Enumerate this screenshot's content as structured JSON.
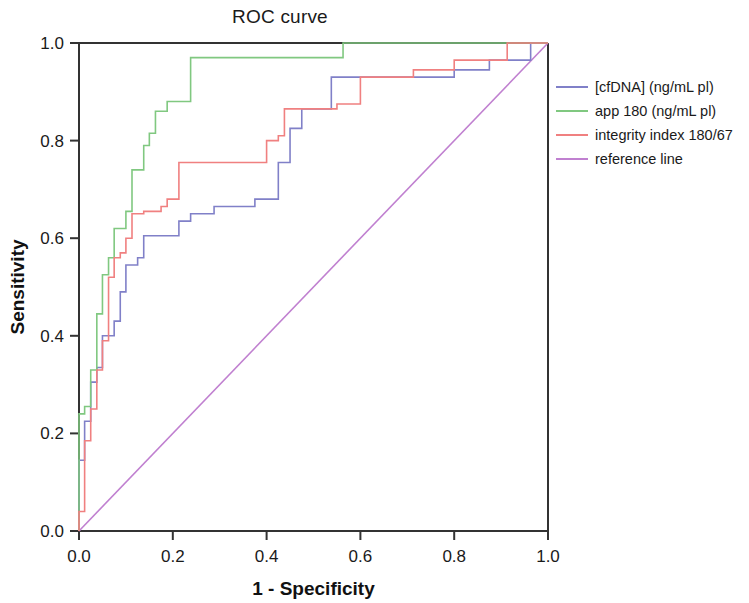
{
  "chart_data": {
    "type": "line",
    "title": "ROC curve",
    "xlabel": "1 - Specificity",
    "ylabel": "Sensitivity",
    "xlim": [
      0.0,
      1.0
    ],
    "ylim": [
      0.0,
      1.0
    ],
    "xticks": [
      "0.0",
      "0.2",
      "0.4",
      "0.6",
      "0.8",
      "1.0"
    ],
    "yticks": [
      "0.0",
      "0.2",
      "0.4",
      "0.6",
      "0.8",
      "1.0"
    ],
    "xtick_values": [
      0.0,
      0.2,
      0.4,
      0.6,
      0.8,
      1.0
    ],
    "ytick_values": [
      0.0,
      0.2,
      0.4,
      0.6,
      0.8,
      1.0
    ],
    "grid": false,
    "legend_position": "right",
    "colors": {
      "cfdna": "#8080c8",
      "app180": "#80c880",
      "integrity": "#f08080",
      "reference": "#c080d0",
      "axis": "#333333",
      "text": "#1a1a1a",
      "background": "#ffffff"
    },
    "series": [
      {
        "name": "[cfDNA] (ng/mL pl)",
        "color": "#8080c8",
        "step": true,
        "points": [
          [
            0.0,
            0.0
          ],
          [
            0.0,
            0.145
          ],
          [
            0.012,
            0.145
          ],
          [
            0.012,
            0.225
          ],
          [
            0.025,
            0.225
          ],
          [
            0.025,
            0.305
          ],
          [
            0.038,
            0.305
          ],
          [
            0.038,
            0.335
          ],
          [
            0.05,
            0.335
          ],
          [
            0.05,
            0.4
          ],
          [
            0.075,
            0.4
          ],
          [
            0.075,
            0.43
          ],
          [
            0.088,
            0.43
          ],
          [
            0.088,
            0.49
          ],
          [
            0.1,
            0.49
          ],
          [
            0.1,
            0.545
          ],
          [
            0.125,
            0.545
          ],
          [
            0.125,
            0.56
          ],
          [
            0.138,
            0.56
          ],
          [
            0.138,
            0.605
          ],
          [
            0.213,
            0.605
          ],
          [
            0.213,
            0.635
          ],
          [
            0.238,
            0.635
          ],
          [
            0.238,
            0.65
          ],
          [
            0.288,
            0.65
          ],
          [
            0.288,
            0.665
          ],
          [
            0.375,
            0.665
          ],
          [
            0.375,
            0.68
          ],
          [
            0.425,
            0.68
          ],
          [
            0.425,
            0.755
          ],
          [
            0.45,
            0.755
          ],
          [
            0.45,
            0.825
          ],
          [
            0.475,
            0.825
          ],
          [
            0.475,
            0.865
          ],
          [
            0.538,
            0.865
          ],
          [
            0.538,
            0.93
          ],
          [
            0.8,
            0.93
          ],
          [
            0.8,
            0.945
          ],
          [
            0.875,
            0.945
          ],
          [
            0.875,
            0.965
          ],
          [
            0.963,
            0.965
          ],
          [
            0.963,
            1.0
          ],
          [
            1.0,
            1.0
          ]
        ]
      },
      {
        "name": "app 180 (ng/mL pl)",
        "color": "#80c880",
        "step": true,
        "points": [
          [
            0.0,
            0.0
          ],
          [
            0.0,
            0.24
          ],
          [
            0.012,
            0.24
          ],
          [
            0.012,
            0.255
          ],
          [
            0.025,
            0.255
          ],
          [
            0.025,
            0.33
          ],
          [
            0.038,
            0.33
          ],
          [
            0.038,
            0.445
          ],
          [
            0.05,
            0.445
          ],
          [
            0.05,
            0.525
          ],
          [
            0.063,
            0.525
          ],
          [
            0.063,
            0.56
          ],
          [
            0.075,
            0.56
          ],
          [
            0.075,
            0.62
          ],
          [
            0.1,
            0.62
          ],
          [
            0.1,
            0.655
          ],
          [
            0.113,
            0.655
          ],
          [
            0.113,
            0.74
          ],
          [
            0.138,
            0.74
          ],
          [
            0.138,
            0.79
          ],
          [
            0.15,
            0.79
          ],
          [
            0.15,
            0.815
          ],
          [
            0.163,
            0.815
          ],
          [
            0.163,
            0.86
          ],
          [
            0.188,
            0.86
          ],
          [
            0.188,
            0.88
          ],
          [
            0.238,
            0.88
          ],
          [
            0.238,
            0.97
          ],
          [
            0.563,
            0.97
          ],
          [
            0.563,
            1.0
          ],
          [
            1.0,
            1.0
          ]
        ]
      },
      {
        "name": "integrity index 180/67",
        "color": "#f08080",
        "step": true,
        "points": [
          [
            0.0,
            0.0
          ],
          [
            0.0,
            0.04
          ],
          [
            0.012,
            0.04
          ],
          [
            0.012,
            0.185
          ],
          [
            0.025,
            0.185
          ],
          [
            0.025,
            0.25
          ],
          [
            0.038,
            0.25
          ],
          [
            0.038,
            0.33
          ],
          [
            0.05,
            0.33
          ],
          [
            0.05,
            0.39
          ],
          [
            0.063,
            0.39
          ],
          [
            0.063,
            0.52
          ],
          [
            0.075,
            0.52
          ],
          [
            0.075,
            0.56
          ],
          [
            0.088,
            0.56
          ],
          [
            0.088,
            0.57
          ],
          [
            0.1,
            0.57
          ],
          [
            0.1,
            0.6
          ],
          [
            0.113,
            0.6
          ],
          [
            0.113,
            0.65
          ],
          [
            0.138,
            0.65
          ],
          [
            0.138,
            0.655
          ],
          [
            0.175,
            0.655
          ],
          [
            0.175,
            0.665
          ],
          [
            0.188,
            0.665
          ],
          [
            0.188,
            0.68
          ],
          [
            0.213,
            0.68
          ],
          [
            0.213,
            0.755
          ],
          [
            0.4,
            0.755
          ],
          [
            0.4,
            0.8
          ],
          [
            0.425,
            0.8
          ],
          [
            0.425,
            0.81
          ],
          [
            0.438,
            0.81
          ],
          [
            0.438,
            0.865
          ],
          [
            0.55,
            0.865
          ],
          [
            0.55,
            0.875
          ],
          [
            0.6,
            0.875
          ],
          [
            0.6,
            0.93
          ],
          [
            0.713,
            0.93
          ],
          [
            0.713,
            0.945
          ],
          [
            0.8,
            0.945
          ],
          [
            0.8,
            0.965
          ],
          [
            0.913,
            0.965
          ],
          [
            0.913,
            1.0
          ],
          [
            1.0,
            1.0
          ]
        ]
      },
      {
        "name": "reference line",
        "color": "#c080d0",
        "step": false,
        "points": [
          [
            0.0,
            0.0
          ],
          [
            1.0,
            1.0
          ]
        ]
      }
    ]
  },
  "legend": {
    "items": [
      {
        "label": "[cfDNA] (ng/mL pl)",
        "color": "#8080c8"
      },
      {
        "label": "app 180 (ng/mL pl)",
        "color": "#80c880"
      },
      {
        "label": "integrity index 180/67",
        "color": "#f08080"
      },
      {
        "label": "reference line",
        "color": "#c080d0"
      }
    ]
  }
}
